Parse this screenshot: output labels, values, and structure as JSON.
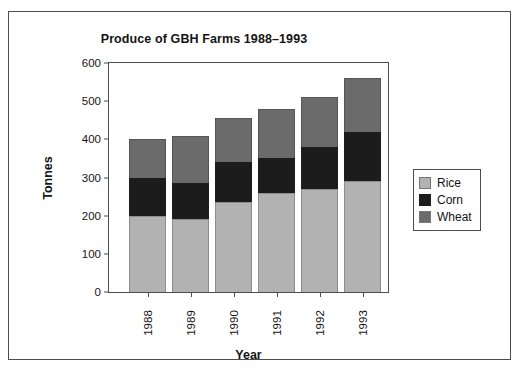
{
  "chart_data": {
    "type": "bar",
    "subtype": "stacked",
    "title": "Produce of GBH Farms 1988–1993",
    "xlabel": "Year",
    "ylabel": "Tonnes",
    "categories": [
      "1988",
      "1989",
      "1990",
      "1991",
      "1992",
      "1993"
    ],
    "ylim": [
      0,
      600
    ],
    "yticks": [
      0,
      100,
      200,
      300,
      400,
      500,
      600
    ],
    "grid": false,
    "legend_position": "right",
    "series": [
      {
        "name": "Rice",
        "color": "#b2b2b2",
        "values": [
          200,
          190,
          235,
          260,
          270,
          290
        ]
      },
      {
        "name": "Corn",
        "color": "#1c1c1c",
        "values": [
          100,
          95,
          105,
          90,
          110,
          130
        ]
      },
      {
        "name": "Wheat",
        "color": "#6b6b6b",
        "values": [
          100,
          125,
          115,
          130,
          130,
          140
        ]
      }
    ],
    "totals": [
      400,
      410,
      455,
      480,
      510,
      560
    ]
  },
  "legend": {
    "items": [
      {
        "label": "Rice"
      },
      {
        "label": "Corn"
      },
      {
        "label": "Wheat"
      }
    ]
  }
}
